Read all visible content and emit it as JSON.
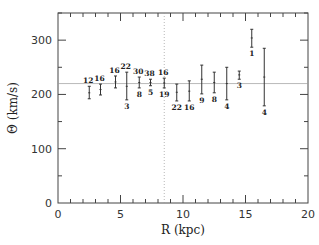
{
  "chart_data": {
    "type": "scatter",
    "subtype": "errorbar",
    "title": "",
    "xlabel": "R (kpc)",
    "ylabel": "Θ (km/s)",
    "xlim": [
      0,
      20
    ],
    "ylim": [
      0,
      350
    ],
    "x_ticks": [
      0,
      5,
      10,
      15,
      20
    ],
    "y_ticks": [
      0,
      100,
      200,
      300
    ],
    "x_minor_step": 1,
    "y_minor_step": 50,
    "grid": false,
    "legend": null,
    "reference_lines": {
      "horizontal_theta": 220,
      "vertical_R": 8.5
    },
    "points": [
      {
        "R": 2.5,
        "theta": 203,
        "lo": 192,
        "hi": 215,
        "label_top": "12",
        "label_bottom": ""
      },
      {
        "R": 3.4,
        "theta": 209,
        "lo": 199,
        "hi": 219,
        "label_top": "16",
        "label_bottom": ""
      },
      {
        "R": 4.6,
        "theta": 223,
        "lo": 212,
        "hi": 234,
        "label_top": "16",
        "label_bottom": ""
      },
      {
        "R": 5.5,
        "theta": 215,
        "lo": 190,
        "hi": 241,
        "label_top": "22",
        "label_bottom": "3"
      },
      {
        "R": 6.5,
        "theta": 222,
        "lo": 212,
        "hi": 232,
        "label_top": "30",
        "label_bottom": "8"
      },
      {
        "R": 7.4,
        "theta": 222,
        "lo": 216,
        "hi": 228,
        "label_top": "38",
        "label_bottom": "5"
      },
      {
        "R": 8.5,
        "theta": 221,
        "lo": 212,
        "hi": 230,
        "label_top": "16",
        "label_bottom": "19"
      },
      {
        "R": 9.5,
        "theta": 204,
        "lo": 188,
        "hi": 219,
        "label_top": "",
        "label_bottom": "22"
      },
      {
        "R": 10.5,
        "theta": 206,
        "lo": 188,
        "hi": 225,
        "label_top": "",
        "label_bottom": "16"
      },
      {
        "R": 11.5,
        "theta": 228,
        "lo": 201,
        "hi": 254,
        "label_top": "",
        "label_bottom": "9"
      },
      {
        "R": 12.5,
        "theta": 222,
        "lo": 203,
        "hi": 241,
        "label_top": "",
        "label_bottom": "8"
      },
      {
        "R": 13.5,
        "theta": 220,
        "lo": 190,
        "hi": 250,
        "label_top": "",
        "label_bottom": "4"
      },
      {
        "R": 14.5,
        "theta": 236,
        "lo": 228,
        "hi": 243,
        "label_top": "",
        "label_bottom": "3"
      },
      {
        "R": 15.5,
        "theta": 304,
        "lo": 287,
        "hi": 320,
        "label_top": "",
        "label_bottom": "1"
      },
      {
        "R": 16.5,
        "theta": 232,
        "lo": 179,
        "hi": 285,
        "label_top": "",
        "label_bottom": "4"
      }
    ]
  },
  "axes": {
    "xlabel": "R (kpc)",
    "ylabel": "Θ (km/s)",
    "x_tick_labels": [
      "0",
      "5",
      "10",
      "15",
      "20"
    ],
    "y_tick_labels": [
      "0",
      "100",
      "200",
      "300"
    ]
  }
}
